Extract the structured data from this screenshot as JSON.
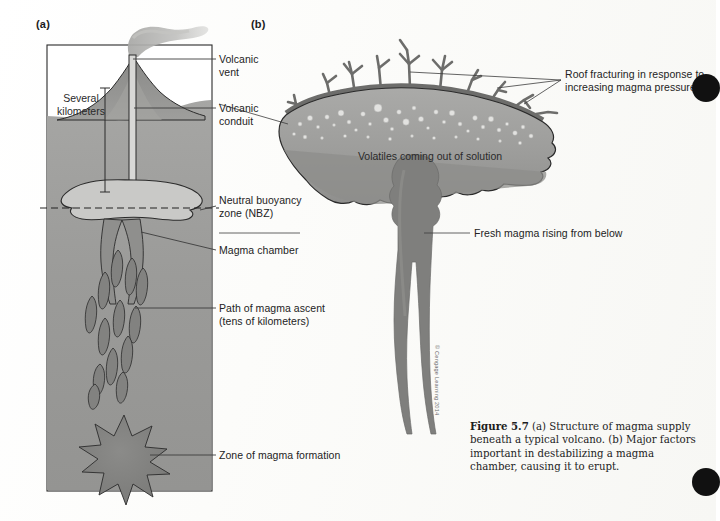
{
  "figure": {
    "number": "Figure 5.7",
    "caption_text": " (a) Structure of magma supply beneath a typical volcano. (b) Major factors important in destabilizing a magma chamber, causing it to erupt.",
    "copyright": "© Cengage Learning 2014"
  },
  "panels": {
    "a": {
      "letter": "(a)",
      "inside_labels": [
        {
          "name": "several-kilometers",
          "text": "Several\nkilometers"
        }
      ],
      "callouts": [
        {
          "name": "volcanic-vent",
          "text": "Volcanic\nvent"
        },
        {
          "name": "volcanic-conduit",
          "text": "Volcanic\nconduit"
        },
        {
          "name": "neutral-buoyancy-zone",
          "text": "Neutral buoyancy\nzone (NBZ)"
        },
        {
          "name": "magma-chamber",
          "text": "Magma chamber"
        },
        {
          "name": "path-of-magma-ascent",
          "text": "Path of magma ascent\n(tens of kilometers)"
        },
        {
          "name": "zone-of-magma-formation",
          "text": "Zone of magma formation"
        }
      ]
    },
    "b": {
      "letter": "(b)",
      "inside_labels": [
        {
          "name": "volatiles-coming-out-of-solution",
          "text": "Volatiles coming out of solution"
        }
      ],
      "callouts": [
        {
          "name": "roof-fracturing",
          "text": "Roof fracturing in response to\nincreasing magma pressure"
        },
        {
          "name": "fresh-magma-rising",
          "text": "Fresh magma rising from below"
        }
      ]
    }
  },
  "colors": {
    "crust_fill": "#9a9a9a",
    "crust_fill_light": "#a8a8a8",
    "mountain_fill": "#8e8e8e",
    "magma_light": "#c9c9c7",
    "magma_mid": "#9c9c9a",
    "magma_dark": "#7c7c7a",
    "chamber_fill": "#a2a2a0",
    "plume": "#b4b4b2",
    "outline": "#2b2b2b",
    "leader_line": "#4a4a4a",
    "sky": "#ffffff"
  }
}
